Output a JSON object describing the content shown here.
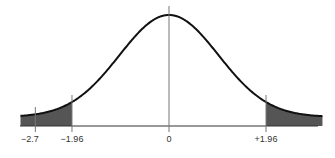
{
  "chart_data": {
    "type": "area",
    "title": "",
    "xlabel": "",
    "ylabel": "",
    "distribution": "standard normal",
    "xlim": [
      -3.0,
      3.1
    ],
    "x_ticks": [
      {
        "value": -2.7,
        "label": "−2.7"
      },
      {
        "value": -1.96,
        "label": "−1.96"
      },
      {
        "value": 0,
        "label": "0"
      },
      {
        "value": 1.96,
        "label": "+1.96"
      }
    ],
    "shaded_regions": [
      {
        "from": -3.0,
        "to": -1.96,
        "label": "left tail"
      },
      {
        "from": 1.96,
        "to": 3.1,
        "label": "right tail"
      }
    ],
    "grid": false,
    "legend": null
  },
  "colors": {
    "curve": "#111111",
    "shade": "#555555",
    "axis": "#333333",
    "tick": "#777777"
  }
}
